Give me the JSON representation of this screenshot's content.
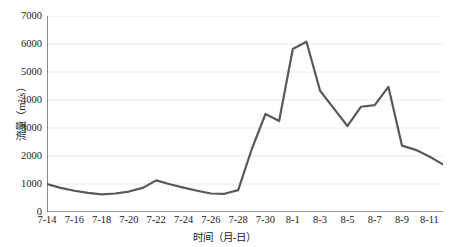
{
  "chart_data": {
    "type": "line",
    "title": "",
    "xlabel": "时间（月-日）",
    "ylabel": "流量（m³/s）",
    "ylim": [
      0,
      7000
    ],
    "ytick_values": [
      0,
      1000,
      2000,
      3000,
      4000,
      5000,
      6000,
      7000
    ],
    "ytick_labels": [
      "0",
      "1000",
      "2000",
      "3000",
      "4000",
      "5000",
      "6000",
      "7000"
    ],
    "grid": "horizontal",
    "legend": "none",
    "line_color": "#595959",
    "line_width": 2.2,
    "x": [
      "7-14",
      "7-15",
      "7-16",
      "7-17",
      "7-18",
      "7-19",
      "7-20",
      "7-21",
      "7-22",
      "7-23",
      "7-24",
      "7-25",
      "7-26",
      "7-27",
      "7-28",
      "7-29",
      "7-30",
      "7-31",
      "8-1",
      "8-2",
      "8-3",
      "8-4",
      "8-5",
      "8-6",
      "8-7",
      "8-8",
      "8-9",
      "8-10",
      "8-11",
      "8-12"
    ],
    "xtick_labels": [
      "7-14",
      "7-16",
      "7-18",
      "7-20",
      "7-22",
      "7-24",
      "7-26",
      "7-28",
      "7-30",
      "8-1",
      "8-3",
      "8-5",
      "8-7",
      "8-9",
      "8-11"
    ],
    "xtick_indices": [
      0,
      2,
      4,
      6,
      8,
      10,
      12,
      14,
      16,
      18,
      20,
      22,
      24,
      26,
      28
    ],
    "values": [
      1000,
      860,
      760,
      680,
      630,
      660,
      730,
      860,
      1130,
      990,
      870,
      760,
      660,
      650,
      780,
      2250,
      3500,
      3250,
      5820,
      6080,
      4330,
      3700,
      3070,
      3760,
      3820,
      4470,
      2370,
      2220,
      1980,
      1700
    ]
  }
}
